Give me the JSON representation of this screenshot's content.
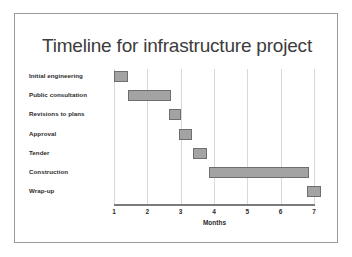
{
  "slide": {
    "title": "Timeline for infrastructure project",
    "frame_color": "#9a9a9a",
    "background": "#ffffff"
  },
  "chart_data": {
    "type": "bar",
    "subtype": "gantt",
    "title": "Timeline for infrastructure project",
    "xlabel": "Months",
    "ylabel": "",
    "xlim": [
      1,
      7
    ],
    "xticks": [
      1,
      2,
      3,
      4,
      5,
      6,
      7
    ],
    "xtick_labels": [
      "1",
      "2",
      "3",
      "4",
      "5",
      "6",
      "7"
    ],
    "grid": "vertical",
    "legend": "none",
    "bar_fill": "#a3a3a3",
    "bar_border": "#6e6e6e",
    "categories": [
      "Initial engineering",
      "Public consultation",
      "Revisions to plans",
      "Approval",
      "Tender",
      "Construction",
      "Wrap-up"
    ],
    "tasks": [
      {
        "name": "Initial engineering",
        "start": 1.0,
        "end": 1.42,
        "duration": 0.42
      },
      {
        "name": "Public consultation",
        "start": 1.42,
        "end": 2.72,
        "duration": 1.3
      },
      {
        "name": "Revisions to plans",
        "start": 2.65,
        "end": 3.02,
        "duration": 0.37
      },
      {
        "name": "Approval",
        "start": 2.95,
        "end": 3.35,
        "duration": 0.4
      },
      {
        "name": "Tender",
        "start": 3.38,
        "end": 3.78,
        "duration": 0.4
      },
      {
        "name": "Construction",
        "start": 3.85,
        "end": 6.85,
        "duration": 3.0
      },
      {
        "name": "Wrap-up",
        "start": 6.78,
        "end": 7.22,
        "duration": 0.44
      }
    ]
  }
}
